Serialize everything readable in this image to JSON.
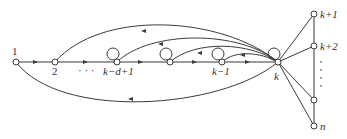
{
  "diagram": {
    "type": "directed-graph",
    "nodes": {
      "n1": "1",
      "n2": "2",
      "nkd1": "k−d+1",
      "nkm1": "k−1",
      "nk": "k",
      "nkp1": "k+1",
      "nkp2": "k+2",
      "nnm1": "n−1",
      "nn": "n"
    },
    "ellipsis_horizontal": "· · ·",
    "ellipsis_vertical": "·\n·\n·\n·",
    "edges_description": [
      "1 → 2 → ... → k−d+1 → ... → k−1 → k (forward chain)",
      "k → 1 (lower arc)",
      "k → 2 (upper arc)",
      "k → k−d+1, k → middle node, k → k−1 (upper arcs)",
      "self-loops on k−d+1, middle node, k−1, k",
      "k connected to k+1, k+2, n−1, n",
      "k+1 — k+2 — ... — n−1 — n (vertical chain)"
    ]
  }
}
